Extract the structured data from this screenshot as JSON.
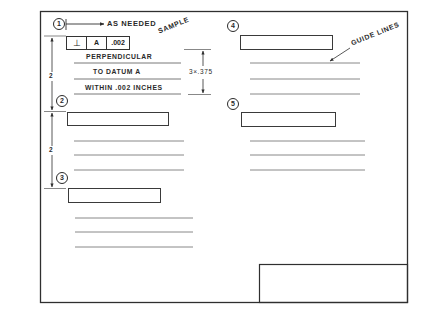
{
  "sheet": {
    "title_block": "",
    "sample_label": "SAMPLE",
    "guide_lines_label": "GUIDE LINES"
  },
  "callouts": [
    {
      "number": "1",
      "label": "AS NEEDED"
    },
    {
      "number": "2"
    },
    {
      "number": "3"
    },
    {
      "number": "4"
    },
    {
      "number": "5"
    }
  ],
  "feature_control_frame": {
    "symbol": "⊥",
    "datum": "A",
    "tolerance": ".002"
  },
  "note_lines": [
    "PERPENDICULAR",
    "TO DATUM A",
    "WITHIN .002 INCHES"
  ],
  "dimensions": {
    "line_spacing": "3×.375",
    "vertical_1": "2",
    "vertical_2": "2"
  },
  "colors": {
    "line": "#2f2f2f",
    "guide": "#6a6a6a",
    "background": "#ffffff"
  }
}
